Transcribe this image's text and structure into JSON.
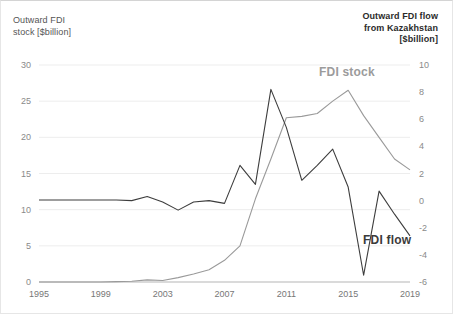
{
  "axis_titles": {
    "left": "Outward FDI\nstock [$billion]",
    "right": "Outward FDI flow\nfrom Kazakhstan\n[$billion]"
  },
  "series_labels": {
    "stock": "FDI stock",
    "flow": "FDI flow"
  },
  "colors": {
    "stock_line": "#9a9a9a",
    "flow_line": "#3d3d3d",
    "gridline": "#ededed",
    "axis_text": "#8a8a8a",
    "background": "#ffffff"
  },
  "ticks": {
    "left": [
      "30",
      "25",
      "20",
      "15",
      "10",
      "5",
      "0"
    ],
    "right": [
      "10",
      "8",
      "6",
      "4",
      "2",
      "0",
      "-2",
      "-4",
      "-6"
    ],
    "x": [
      "1995",
      "1999",
      "2003",
      "2007",
      "2011",
      "2015",
      "2019"
    ]
  },
  "chart_data": {
    "type": "line",
    "title": "",
    "subtitle": "",
    "xlabel": "",
    "ylabel": "Outward FDI stock [$billion]",
    "y2label": "Outward FDI flow from Kazakhstan [$billion]",
    "xlim": [
      1995,
      2019
    ],
    "ylim": [
      0,
      30
    ],
    "y2lim": [
      -6,
      10
    ],
    "grid": true,
    "legend": "inline-annotations",
    "x": [
      1995,
      1996,
      1997,
      1998,
      1999,
      2000,
      2001,
      2002,
      2003,
      2004,
      2005,
      2006,
      2007,
      2008,
      2009,
      2010,
      2011,
      2012,
      2013,
      2014,
      2015,
      2016,
      2017,
      2018,
      2019
    ],
    "series": [
      {
        "name": "FDI stock",
        "axis": "left",
        "units": "$billion",
        "values": [
          0.0,
          0.0,
          0.0,
          0.0,
          0.0,
          0.05,
          0.1,
          0.3,
          0.2,
          0.6,
          1.1,
          1.7,
          3.0,
          5.0,
          11.5,
          17.0,
          22.7,
          22.9,
          23.3,
          25.0,
          26.5,
          23.0,
          20.0,
          17.0,
          15.5
        ]
      },
      {
        "name": "FDI flow",
        "axis": "right",
        "units": "$billion",
        "values": [
          0.05,
          0.05,
          0.05,
          0.05,
          0.05,
          0.05,
          0.0,
          0.3,
          -0.1,
          -0.7,
          -0.1,
          0.0,
          -0.2,
          2.6,
          1.2,
          8.2,
          5.4,
          1.5,
          2.6,
          3.8,
          1.0,
          -5.5,
          0.7,
          -1.0,
          -2.6
        ]
      }
    ]
  }
}
